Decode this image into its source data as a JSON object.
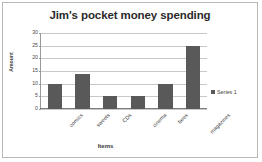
{
  "chart_data": {
    "type": "bar",
    "title": "Jim's pocket money spending",
    "xlabel": "Items",
    "ylabel": "Amount",
    "categories": [
      "comics",
      "sweets",
      "CDs",
      "cinema",
      "fares",
      "magazines"
    ],
    "values": [
      10,
      14,
      5,
      5,
      10,
      25
    ],
    "series": [
      {
        "name": "Series 1",
        "values": [
          10,
          14,
          5,
          5,
          10,
          25
        ]
      }
    ],
    "ylim": [
      0,
      30
    ],
    "ytick_step": 5,
    "yticks": [
      30,
      25,
      20,
      15,
      10,
      5,
      0
    ],
    "grid": true,
    "legend": [
      "Series 1"
    ],
    "legend_position": "right",
    "bar_color": "#595959",
    "gridline_color": "#c8c8c8",
    "axis_color": "#7d7d7d",
    "frame_color": "#b9b9b9",
    "xlabel_rotation": -45
  }
}
